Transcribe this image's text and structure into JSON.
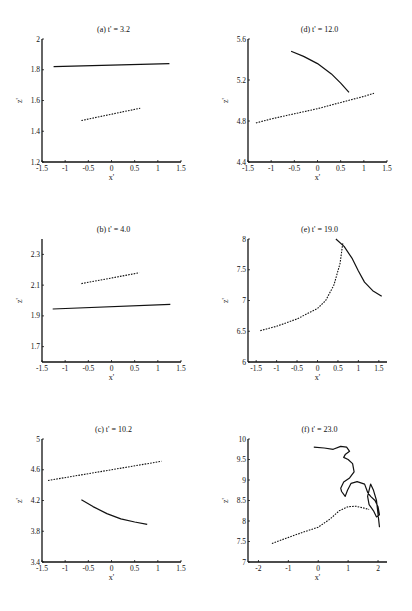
{
  "chart_data": [
    {
      "id": "a",
      "type": "line",
      "title": "(a)  t' = 3.2",
      "xlabel": "x'",
      "ylabel": "z'",
      "xlim": [
        -1.5,
        1.5
      ],
      "ylim": [
        1.2,
        2.0
      ],
      "xticks": [
        "-1.5",
        "-1",
        "-0.5",
        "0",
        "0.5",
        "1",
        "1.5"
      ],
      "xtick_values": [
        -1.5,
        -1,
        -0.5,
        0,
        0.5,
        1,
        1.5
      ],
      "yticks": [
        "1.2",
        "1.4",
        "1.6",
        "1.8",
        "2"
      ],
      "ytick_values": [
        1.2,
        1.4,
        1.6,
        1.8,
        2.0
      ],
      "grid": false,
      "series": [
        {
          "name": "solid",
          "style": "solid",
          "x": [
            -1.25,
            1.25
          ],
          "y": [
            1.82,
            1.84
          ]
        },
        {
          "name": "dotted",
          "style": "dotted",
          "x": [
            -0.65,
            0.62
          ],
          "y": [
            1.47,
            1.55
          ]
        }
      ]
    },
    {
      "id": "d",
      "type": "line",
      "title": "(d)  t' = 12.0",
      "xlabel": "x'",
      "ylabel": "z'",
      "xlim": [
        -1.5,
        1.5
      ],
      "ylim": [
        4.4,
        5.6
      ],
      "xticks": [
        "-1.5",
        "-1",
        "-0.5",
        "0",
        "0.5",
        "1",
        "1.5"
      ],
      "xtick_values": [
        -1.5,
        -1,
        -0.5,
        0,
        0.5,
        1,
        1.5
      ],
      "yticks": [
        "4.4",
        "4.8",
        "5.2",
        "5.6"
      ],
      "ytick_values": [
        4.4,
        4.8,
        5.2,
        5.6
      ],
      "grid": false,
      "series": [
        {
          "name": "solid",
          "style": "solid",
          "x": [
            -0.57,
            -0.3,
            0.0,
            0.3,
            0.5,
            0.68
          ],
          "y": [
            5.48,
            5.43,
            5.36,
            5.26,
            5.17,
            5.08
          ]
        },
        {
          "name": "dotted",
          "style": "dotted",
          "x": [
            -1.33,
            -1.0,
            -0.5,
            0.0,
            0.5,
            1.0,
            1.22
          ],
          "y": [
            4.78,
            4.82,
            4.87,
            4.92,
            4.98,
            5.04,
            5.07
          ]
        }
      ]
    },
    {
      "id": "b",
      "type": "line",
      "title": "(b)  t' = 4.0",
      "xlabel": "x'",
      "ylabel": "z'",
      "xlim": [
        -1.5,
        1.5
      ],
      "ylim": [
        1.6,
        2.4
      ],
      "xticks": [
        "-1.5",
        "-1",
        "-0.5",
        "0",
        "0.5",
        "1",
        "1.5"
      ],
      "xtick_values": [
        -1.5,
        -1,
        -0.5,
        0,
        0.5,
        1,
        1.5
      ],
      "yticks": [
        "1.7",
        "1.9",
        "2.1",
        "2.3"
      ],
      "ytick_values": [
        1.7,
        1.9,
        2.1,
        2.3
      ],
      "grid": false,
      "series": [
        {
          "name": "solid",
          "style": "solid",
          "x": [
            -1.27,
            1.27
          ],
          "y": [
            1.945,
            1.975
          ]
        },
        {
          "name": "dotted",
          "style": "dotted",
          "x": [
            -0.65,
            0.6
          ],
          "y": [
            2.11,
            2.18
          ]
        }
      ]
    },
    {
      "id": "e",
      "type": "line",
      "title": "(e)  t' = 19.0",
      "xlabel": "x'",
      "ylabel": "z'",
      "xlim": [
        -1.7,
        1.7
      ],
      "ylim": [
        6.0,
        8.0
      ],
      "xticks": [
        "-1.5",
        "-1",
        "-0.5",
        "0",
        "0.5",
        "1",
        "1.5"
      ],
      "xtick_values": [
        -1.5,
        -1,
        -0.5,
        0,
        0.5,
        1,
        1.5
      ],
      "yticks": [
        "6",
        "6.5",
        "7",
        "7.5",
        "8"
      ],
      "ytick_values": [
        6,
        6.5,
        7,
        7.5,
        8
      ],
      "grid": false,
      "series": [
        {
          "name": "solid",
          "style": "solid",
          "x": [
            0.45,
            0.65,
            0.85,
            1.0,
            1.15,
            1.35,
            1.57
          ],
          "y": [
            8.0,
            7.88,
            7.68,
            7.48,
            7.3,
            7.16,
            7.07
          ]
        },
        {
          "name": "dotted",
          "style": "dotted",
          "x": [
            -1.4,
            -1.0,
            -0.5,
            0.0,
            0.2,
            0.4,
            0.55,
            0.62
          ],
          "y": [
            6.51,
            6.58,
            6.7,
            6.87,
            7.0,
            7.25,
            7.6,
            7.93
          ]
        }
      ]
    },
    {
      "id": "c",
      "type": "line",
      "title": "(c)  t' = 10.2",
      "xlabel": "x'",
      "ylabel": "z'",
      "xlim": [
        -1.5,
        1.5
      ],
      "ylim": [
        3.4,
        5.0
      ],
      "xticks": [
        "-1.5",
        "-1",
        "-0.5",
        "0",
        "0.5",
        "1",
        "1.5"
      ],
      "xtick_values": [
        -1.5,
        -1,
        -0.5,
        0,
        0.5,
        1,
        1.5
      ],
      "yticks": [
        "3.4",
        "3.8",
        "4.2",
        "4.6",
        "5"
      ],
      "ytick_values": [
        3.4,
        3.8,
        4.2,
        4.6,
        5.0
      ],
      "grid": false,
      "series": [
        {
          "name": "solid",
          "style": "solid",
          "x": [
            -0.65,
            -0.4,
            -0.1,
            0.2,
            0.5,
            0.77
          ],
          "y": [
            4.21,
            4.12,
            4.03,
            3.96,
            3.92,
            3.89
          ]
        },
        {
          "name": "dotted",
          "style": "dotted",
          "x": [
            -1.37,
            1.08
          ],
          "y": [
            4.46,
            4.71
          ]
        }
      ]
    },
    {
      "id": "f",
      "type": "line",
      "title": "(f)  t' = 23.0",
      "xlabel": "x'",
      "ylabel": "z'",
      "xlim": [
        -2.35,
        2.3
      ],
      "ylim": [
        7.0,
        10.0
      ],
      "xticks": [
        "-2",
        "-1",
        "0",
        "1",
        "2"
      ],
      "xtick_values": [
        -2,
        -1,
        0,
        1,
        2
      ],
      "yticks": [
        "7",
        "7.5",
        "8",
        "8.5",
        "9",
        "9.5",
        "10"
      ],
      "ytick_values": [
        7,
        7.5,
        8,
        8.5,
        9,
        9.5,
        10
      ],
      "grid": false,
      "series": [
        {
          "name": "solid",
          "style": "solid",
          "x": [
            -0.15,
            0.2,
            0.5,
            0.75,
            0.95,
            1.05,
            0.9,
            0.85,
            1.0,
            1.15,
            1.2,
            1.05,
            0.85,
            0.75,
            0.78,
            0.9,
            0.98,
            1.1,
            1.3,
            1.55,
            1.65,
            1.75,
            1.9,
            2.0,
            2.05,
            1.95,
            1.85,
            1.7,
            1.65,
            1.75,
            1.85,
            1.95,
            2.05
          ],
          "y": [
            9.8,
            9.78,
            9.75,
            9.82,
            9.8,
            9.7,
            9.62,
            9.55,
            9.5,
            9.4,
            9.2,
            9.05,
            8.95,
            8.8,
            8.72,
            8.6,
            8.75,
            8.92,
            8.96,
            8.9,
            8.7,
            8.6,
            8.5,
            8.35,
            8.15,
            8.1,
            8.25,
            8.4,
            8.6,
            8.9,
            8.75,
            8.5,
            7.85
          ]
        },
        {
          "name": "dotted",
          "style": "dotted",
          "x": [
            -1.55,
            -1.0,
            -0.5,
            0.0,
            0.4,
            0.7,
            1.0,
            1.25,
            1.5,
            1.7
          ],
          "y": [
            7.45,
            7.6,
            7.73,
            7.85,
            8.05,
            8.25,
            8.35,
            8.36,
            8.32,
            8.28
          ]
        }
      ]
    }
  ]
}
